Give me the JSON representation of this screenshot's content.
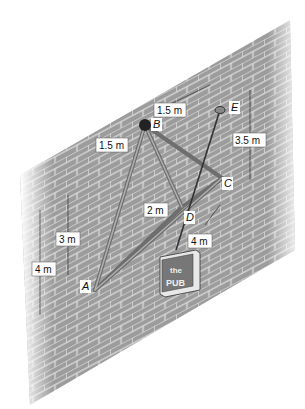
{
  "figure": {
    "points": {
      "A": "A",
      "B": "B",
      "C": "C",
      "D": "D",
      "E": "E"
    },
    "dimensions": {
      "top_left": "1.5 m",
      "top_right": "1.5 m",
      "vertical_E": "3.5 m",
      "depth_D": "2 m",
      "vertical_3": "3 m",
      "vertical_4": "4 m",
      "horizontal_4": "4 m"
    },
    "sign": {
      "line1": "the",
      "line2": "PUB"
    },
    "colors": {
      "wall": "#9a9a9a",
      "mortar": "#d8d8d8",
      "member": "#8a8a8a"
    }
  }
}
